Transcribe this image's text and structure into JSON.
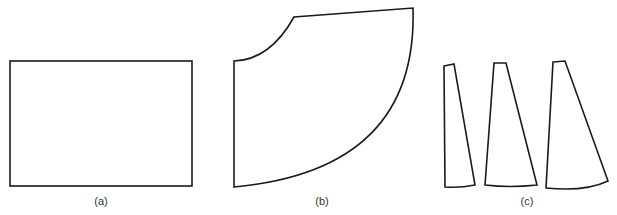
{
  "figure": {
    "panels": [
      {
        "id": "a",
        "label": "(a)",
        "shape": "rectangle",
        "description": "flat rectangular sheet"
      },
      {
        "id": "b",
        "label": "(b)",
        "shape": "annular-sector",
        "description": "quarter-annulus pattern with concave inner arc and convex outer arc"
      },
      {
        "id": "c",
        "label": "(c)",
        "shape": "tapered-gores",
        "description": "three narrow tapered gore pieces of increasing width",
        "count": 3
      }
    ]
  },
  "colors": {
    "stroke": "#1a1a1a",
    "background": "#ffffff",
    "label": "#333333"
  }
}
